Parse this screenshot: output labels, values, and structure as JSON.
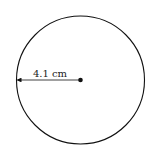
{
  "diagram": {
    "shape": "circle",
    "radius_label": "4.1 cm",
    "stroke_color": "#111111",
    "background": "#ffffff"
  }
}
